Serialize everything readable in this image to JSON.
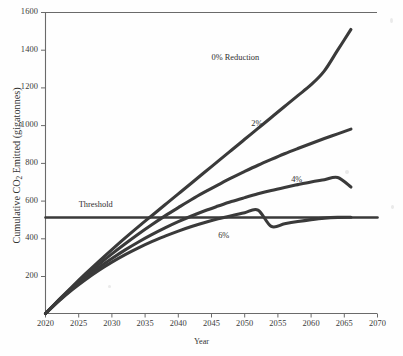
{
  "chart_data": {
    "type": "line",
    "title": "",
    "xlabel": "Year",
    "ylabel": "Cumulative CO2 Emitted (gigatonnes)",
    "ylabel_parts": {
      "pre": "Cumulative CO",
      "sub": "2",
      "post": " Emitted (gigatonnes)"
    },
    "xlim": [
      2020,
      2070
    ],
    "ylim": [
      0,
      1600
    ],
    "xticks": [
      2020,
      2025,
      2030,
      2035,
      2040,
      2045,
      2050,
      2055,
      2060,
      2065,
      2070
    ],
    "yticks": [
      200,
      400,
      600,
      800,
      1000,
      1200,
      1400,
      1600
    ],
    "grid": false,
    "legend_position": "inline-annotations",
    "x": [
      2020,
      2022,
      2024,
      2026,
      2028,
      2030,
      2032,
      2034,
      2036,
      2038,
      2040,
      2042,
      2044,
      2046,
      2048,
      2050,
      2052,
      2054,
      2056,
      2058,
      2060,
      2062,
      2064,
      2066
    ],
    "series": [
      {
        "name": "0% Reduction",
        "label": "0% Reduction",
        "label_x": 2045,
        "label_y": 1355,
        "end_x": 2066,
        "end_y": 1510,
        "values": [
          0,
          72,
          142,
          210,
          276,
          340,
          402,
          462,
          520,
          578,
          636,
          694,
          752,
          810,
          868,
          926,
          984,
          1042,
          1100,
          1158,
          1216,
          1290,
          1400,
          1510
        ]
      },
      {
        "name": "2%",
        "label": "2%",
        "label_x": 2051,
        "label_y": 1000,
        "end_x": 2066,
        "end_y": 980,
        "values": [
          0,
          70,
          137,
          200,
          260,
          317,
          371,
          423,
          472,
          519,
          563,
          606,
          646,
          684,
          721,
          755,
          788,
          819,
          849,
          877,
          904,
          930,
          955,
          980
        ]
      },
      {
        "name": "4%",
        "label": "4%",
        "label_x": 2057,
        "label_y": 705,
        "end_x": 2066,
        "end_y": 672,
        "values": [
          0,
          68,
          131,
          189,
          243,
          292,
          338,
          380,
          419,
          455,
          488,
          518,
          546,
          571,
          595,
          616,
          636,
          654,
          670,
          685,
          699,
          711,
          723,
          672
        ]
      },
      {
        "name": "6%",
        "label": "6%",
        "label_x": 2046,
        "label_y": 405,
        "end_x": 2066,
        "end_y": 512,
        "values": [
          0,
          66,
          126,
          180,
          229,
          273,
          313,
          349,
          382,
          411,
          438,
          462,
          484,
          503,
          520,
          536,
          550,
          463,
          477,
          489,
          499,
          507,
          511,
          512
        ]
      }
    ],
    "reference_lines": [
      {
        "name": "Threshold",
        "label": "Threshold",
        "value": 510,
        "orientation": "horizontal",
        "label_x": 2025,
        "label_y": 570
      }
    ]
  },
  "axis": {
    "y_ticks_text": [
      "1600",
      "1400",
      "1200",
      "1000",
      "800",
      "600",
      "400",
      "200"
    ],
    "x_ticks_text": [
      "2020",
      "2025",
      "2030",
      "2035",
      "2040",
      "2045",
      "2050",
      "2055",
      "2060",
      "2065",
      "2070"
    ],
    "x_title": "Year"
  },
  "colors": {
    "line": "#3a3a3a",
    "axis": "#5a5a5a",
    "text": "#2b2b2b",
    "background": "#ffffff"
  }
}
